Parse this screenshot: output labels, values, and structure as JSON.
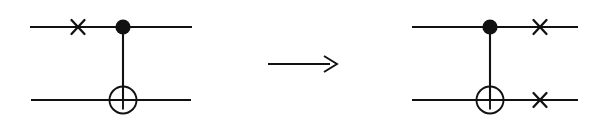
{
  "figure": {
    "kind": "quantum-circuit-identity",
    "description": "Circuit identity: an X gate on the control qubit before a CNOT equals a CNOT followed by X gates on both qubits.",
    "width": 608,
    "height": 125,
    "background_color": "#ffffff",
    "ink_color": "#111111"
  },
  "relation": {
    "symbol": "→",
    "name": "rightwards-arrow",
    "shaft": {
      "x1": 268,
      "x2": 330,
      "y": 64
    },
    "head": {
      "tip_x": 337,
      "tip_y": 64,
      "back_x": 324,
      "half_height": 8
    }
  },
  "circuits": [
    {
      "id": "left-circuit",
      "label": "X on control, then CNOT",
      "wires": [
        {
          "id": "left-wire-top",
          "qubit_index": 0,
          "y": 27,
          "x1": 30,
          "x2": 192
        },
        {
          "id": "left-wire-bottom",
          "qubit_index": 1,
          "y": 100,
          "x1": 31,
          "x2": 191
        }
      ],
      "gates": [
        {
          "id": "left-x-top",
          "type": "x-gate",
          "symbol": "×",
          "wire": 0,
          "cx": 78,
          "cy": 27,
          "arm": 13
        },
        {
          "id": "left-cnot",
          "type": "cnot",
          "control": {
            "cx": 123,
            "cy": 27,
            "r": 7.6,
            "symbol": "●"
          },
          "target": {
            "cx": 123,
            "cy": 100,
            "r": 13.5,
            "symbol": "⊕",
            "cross_arm": 19
          },
          "connector": {
            "x": 123,
            "y1": 27,
            "y2": 100
          }
        }
      ]
    },
    {
      "id": "right-circuit",
      "label": "CNOT, then X on both qubits",
      "wires": [
        {
          "id": "right-wire-top",
          "qubit_index": 0,
          "y": 27,
          "x1": 412,
          "x2": 578
        },
        {
          "id": "right-wire-bottom",
          "qubit_index": 1,
          "y": 100,
          "x1": 412,
          "x2": 578
        }
      ],
      "gates": [
        {
          "id": "right-cnot",
          "type": "cnot",
          "control": {
            "cx": 490,
            "cy": 27,
            "r": 7.6,
            "symbol": "●"
          },
          "target": {
            "cx": 490,
            "cy": 100,
            "r": 13.5,
            "symbol": "⊕",
            "cross_arm": 19
          },
          "connector": {
            "x": 490,
            "y1": 27,
            "y2": 100
          }
        },
        {
          "id": "right-x-top",
          "type": "x-gate",
          "symbol": "×",
          "wire": 0,
          "cx": 540,
          "cy": 27,
          "arm": 13
        },
        {
          "id": "right-x-bottom",
          "type": "x-gate",
          "symbol": "×",
          "wire": 1,
          "cx": 540,
          "cy": 100,
          "arm": 13
        }
      ]
    }
  ]
}
